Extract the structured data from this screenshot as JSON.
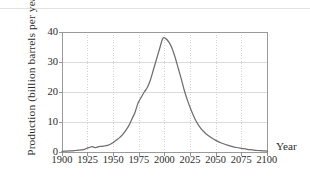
{
  "figure": {
    "background_color": "#ffffff",
    "curve_color": "#6e6e6e",
    "grid_color": "#d0d0d0",
    "axis_color": "#8a8a8a",
    "text_color": "#2b2b2b"
  },
  "axes": {
    "y_title": "Production (billion barrels per year)",
    "x_title": "Year"
  },
  "chart_data": {
    "type": "line",
    "title": "",
    "subtitle": "",
    "xlabel": "Year",
    "ylabel": "Production (billion barrels per year)",
    "xlim": [
      1900,
      2100
    ],
    "ylim": [
      0,
      40
    ],
    "xticks": [
      1900,
      1925,
      1950,
      1975,
      2000,
      2025,
      2050,
      2075,
      2100
    ],
    "xtick_labels": [
      "1900",
      "1925",
      "1950",
      "1975",
      "2000",
      "2025",
      "2050",
      "2075",
      "2100"
    ],
    "yticks": [
      0,
      10,
      20,
      30,
      40
    ],
    "ytick_labels": [
      "0",
      "10",
      "20",
      "30",
      "40"
    ],
    "grid": {
      "horizontal": true,
      "horizontal_style": "solid",
      "vertical": true,
      "vertical_style": "dotted"
    },
    "legend": null,
    "annotations": [],
    "peak": {
      "x": 1998,
      "y": 38
    },
    "series": [
      {
        "name": "World oil production",
        "color": "#6e6e6e",
        "x": [
          1900,
          1905,
          1910,
          1913,
          1916,
          1919,
          1922,
          1925,
          1927,
          1929,
          1931,
          1933,
          1935,
          1937,
          1939,
          1941,
          1943,
          1945,
          1947,
          1950,
          1953,
          1956,
          1959,
          1962,
          1965,
          1968,
          1971,
          1974,
          1977,
          1980,
          1983,
          1986,
          1989,
          1992,
          1995,
          1998,
          2001,
          2004,
          2007,
          2010,
          2013,
          2016,
          2019,
          2022,
          2025,
          2030,
          2035,
          2040,
          2045,
          2050,
          2055,
          2060,
          2065,
          2070,
          2075,
          2080,
          2085,
          2090,
          2095,
          2100
        ],
        "y": [
          0.2,
          0.3,
          0.4,
          0.5,
          0.6,
          0.7,
          0.9,
          1.4,
          1.5,
          1.8,
          1.6,
          1.5,
          1.7,
          1.9,
          1.9,
          2.0,
          2.1,
          2.3,
          2.6,
          3.2,
          4.0,
          4.8,
          5.8,
          7.2,
          8.8,
          11.0,
          13.2,
          16.3,
          18.2,
          20.0,
          21.5,
          24.0,
          27.5,
          31.0,
          34.5,
          37.8,
          37.8,
          36.6,
          34.6,
          31.6,
          28.0,
          24.4,
          20.5,
          17.3,
          14.5,
          10.6,
          7.9,
          6.1,
          4.8,
          3.8,
          3.0,
          2.4,
          1.9,
          1.5,
          1.2,
          0.9,
          0.7,
          0.5,
          0.4,
          0.3
        ]
      }
    ]
  }
}
